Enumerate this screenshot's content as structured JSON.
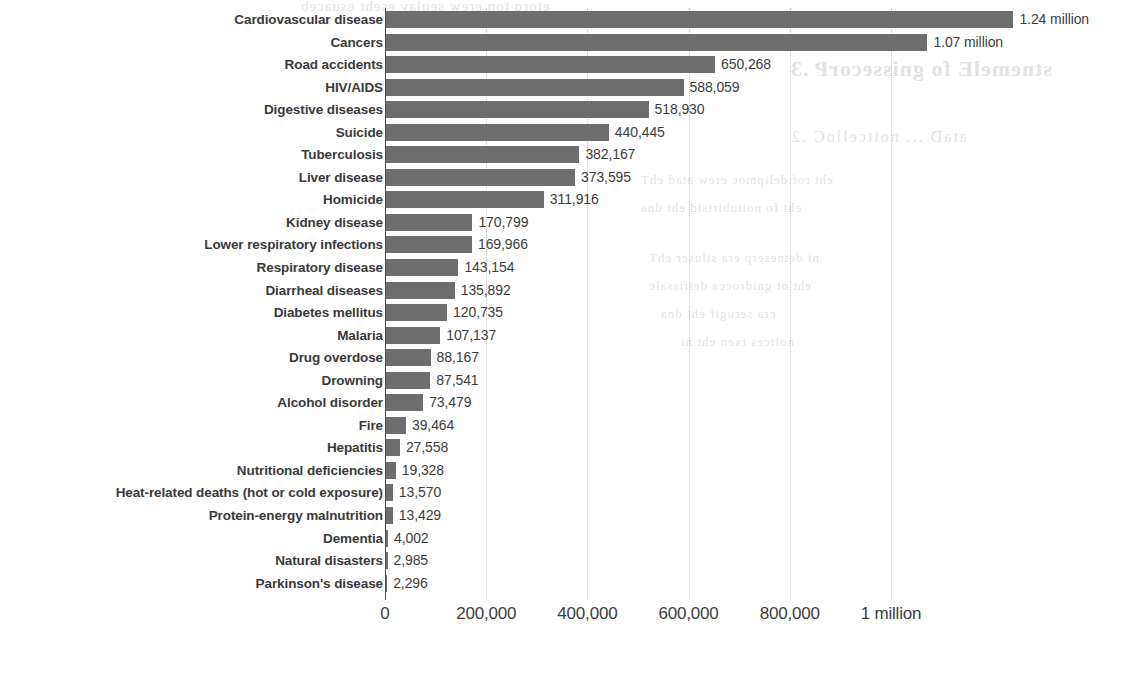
{
  "bleed_through": {
    "line1": "etorq ton erew seulav eseht esuaceb",
    "line2": "stnemelE fo gnissecorP .3",
    "line3": "ataD ... noitcelloC .2",
    "line4": "eht rof delipmoc erew atad ehT",
    "line5": "eht fo noitubirtsid eht dna",
    "line6": "ni detneserp era stluser ehT",
    "line7": "eht ot gnidrocca deifissalc",
    "line8": "era serugif eht dna",
    "line9": "noitces txen eht ni"
  },
  "chart_data": {
    "type": "bar",
    "orientation": "horizontal",
    "title": "",
    "xlabel": "",
    "ylabel": "",
    "xlim": [
      0,
      1300000
    ],
    "grid": true,
    "legend": null,
    "bar_color": "#6e6e6e",
    "axis_color": "#4a4a4a",
    "xticks": [
      {
        "value": 0,
        "label": "0"
      },
      {
        "value": 200000,
        "label": "200,000"
      },
      {
        "value": 400000,
        "label": "400,000"
      },
      {
        "value": 600000,
        "label": "600,000"
      },
      {
        "value": 800000,
        "label": "800,000"
      },
      {
        "value": 1000000,
        "label": "1 million"
      }
    ],
    "categories": [
      "Cardiovascular disease",
      "Cancers",
      "Road accidents",
      "HIV/AIDS",
      "Digestive diseases",
      "Suicide",
      "Tuberculosis",
      "Liver disease",
      "Homicide",
      "Kidney disease",
      "Lower respiratory infections",
      "Respiratory disease",
      "Diarrheal diseases",
      "Diabetes mellitus",
      "Malaria",
      "Drug overdose",
      "Drowning",
      "Alcohol disorder",
      "Fire",
      "Hepatitis",
      "Nutritional deficiencies",
      "Heat-related deaths (hot or cold exposure)",
      "Protein-energy malnutrition",
      "Dementia",
      "Natural disasters",
      "Parkinson's disease"
    ],
    "values": [
      1240000,
      1070000,
      650268,
      588059,
      518930,
      440445,
      382167,
      373595,
      311916,
      170799,
      169966,
      143154,
      135892,
      120735,
      107137,
      88167,
      87541,
      73479,
      39464,
      27558,
      19328,
      13570,
      13429,
      4002,
      2985,
      2296
    ],
    "value_labels": [
      "1.24 million",
      "1.07 million",
      "650,268",
      "588,059",
      "518,930",
      "440,445",
      "382,167",
      "373,595",
      "311,916",
      "170,799",
      "169,966",
      "143,154",
      "135,892",
      "120,735",
      "107,137",
      "88,167",
      "87,541",
      "73,479",
      "39,464",
      "27,558",
      "19,328",
      "13,570",
      "13,429",
      "4,002",
      "2,985",
      "2,296"
    ]
  }
}
